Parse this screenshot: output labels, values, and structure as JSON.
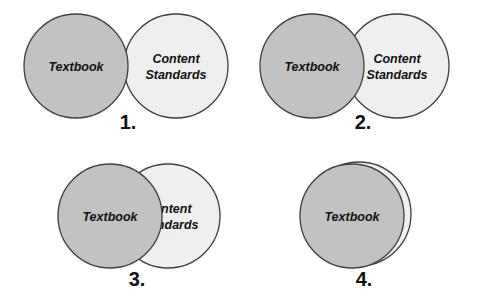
{
  "figure": {
    "background_color": "#ffffff",
    "label_color": "#111111",
    "circle_fill_dark": "#c2c2c2",
    "circle_fill_light": "#efefef",
    "circle_stroke": "#3f3f3f",
    "panels": [
      {
        "number": "1.",
        "number_x": 128,
        "number_y": 123,
        "dark_circle": {
          "cx": 76,
          "cy": 66,
          "r": 52,
          "label": "Textbook",
          "label_lines": [
            "Textbook"
          ],
          "label_x": 76,
          "label_y": 66
        },
        "light_circle": {
          "cx": 176,
          "cy": 66,
          "r": 52,
          "label": "Content Standards",
          "label_lines": [
            "Content",
            "Standards"
          ],
          "label_x": 176,
          "label_y": 66
        },
        "clip_label": false
      },
      {
        "number": "2.",
        "number_x": 363,
        "number_y": 123,
        "dark_circle": {
          "cx": 312,
          "cy": 66,
          "r": 52,
          "label": "Textbook",
          "label_lines": [
            "Textbook"
          ],
          "label_x": 312,
          "label_y": 66
        },
        "light_circle": {
          "cx": 397,
          "cy": 66,
          "r": 52,
          "label": "Content Standards",
          "label_lines": [
            "Content",
            "Standards"
          ],
          "label_x": 397,
          "label_y": 66
        },
        "clip_label": true
      },
      {
        "number": "3.",
        "number_x": 137,
        "number_y": 280,
        "dark_circle": {
          "cx": 110,
          "cy": 216,
          "r": 52,
          "label": "Textbook",
          "label_lines": [
            "Textbook"
          ],
          "label_x": 110,
          "label_y": 216
        },
        "light_circle": {
          "cx": 168,
          "cy": 216,
          "r": 52,
          "label": "Content Standards",
          "label_lines": [
            "Content",
            "Standards"
          ],
          "label_x": 168,
          "label_y": 216
        },
        "clip_label": true
      },
      {
        "number": "4.",
        "number_x": 364,
        "number_y": 280,
        "dark_circle": {
          "cx": 352,
          "cy": 216,
          "r": 52,
          "label": "Textbook",
          "label_lines": [
            "Textbook"
          ],
          "label_x": 352,
          "label_y": 216
        },
        "light_circle": {
          "cx": 359,
          "cy": 214,
          "r": 52,
          "label": "Content Standards",
          "label_lines": [
            "Content",
            "Standards"
          ],
          "label_x": 359,
          "label_y": 214
        },
        "clip_label": true
      }
    ],
    "text_style": {
      "label_font_size": 12.5,
      "label_font_weight": "bold",
      "label_font_style": "italic",
      "number_font_size": 20
    }
  }
}
